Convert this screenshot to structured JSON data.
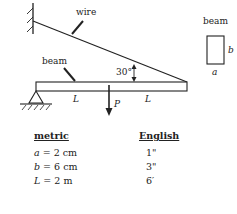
{
  "diagram": {
    "labels": {
      "wire": "wire",
      "beam": "beam",
      "angle": "30°",
      "length_left": "L",
      "length_right": "L",
      "load": "P"
    },
    "cross_section": {
      "title": "beam",
      "width_label": "a",
      "height_label": "b"
    }
  },
  "table": {
    "headers": {
      "metric": "metric",
      "english": "English"
    },
    "rows": [
      {
        "var": "a",
        "eq": " =  2 cm",
        "english": "1\""
      },
      {
        "var": "b",
        "eq": " =  6 cm",
        "english": "3\""
      },
      {
        "var": "L",
        "eq": " =  2 m",
        "english": "6′"
      }
    ]
  }
}
